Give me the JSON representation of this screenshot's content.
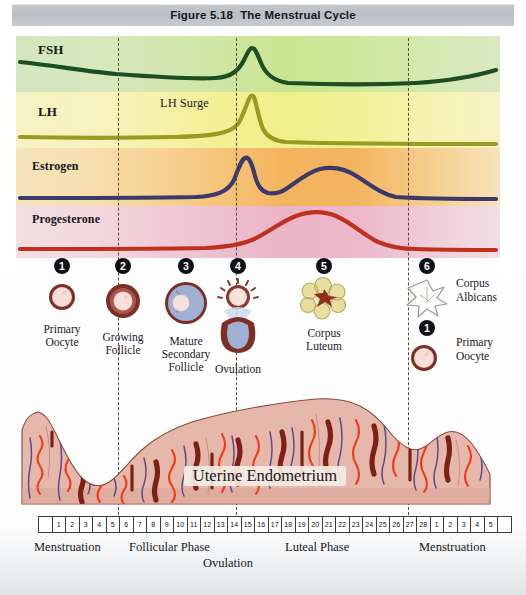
{
  "figure": {
    "number": "Figure 5.18",
    "title": "The Menstrual Cycle"
  },
  "hormones": {
    "fsh": {
      "label": "FSH",
      "color": "#1d4d22",
      "band_color": "#cfe6a4"
    },
    "lh": {
      "label": "LH",
      "color": "#9a9a22",
      "band_color": "#f2f095"
    },
    "estrogen": {
      "label": "Estrogen",
      "color": "#3b3a6b",
      "band_color": "#f4b45e"
    },
    "progesterone": {
      "label": "Progesterone",
      "color": "#c0301d",
      "band_color": "#eab4c6"
    }
  },
  "annotations": {
    "lh_surge": "LH Surge",
    "endometrium": "Uterine Endometrium",
    "ovulation_axis": "Ovulation"
  },
  "stages": [
    {
      "number": "1",
      "label": "Primary\nOocyte",
      "art": "primary-oocyte"
    },
    {
      "number": "2",
      "label": "Growing\nFollicle",
      "art": "growing-follicle"
    },
    {
      "number": "3",
      "label": "Mature\nSecondary\nFollicle",
      "art": "mature-secondary-follicle"
    },
    {
      "number": "4",
      "label": "Ovulation",
      "art": "ovulation"
    },
    {
      "number": "5",
      "label": "Corpus\nLuteum",
      "art": "corpus-luteum"
    },
    {
      "number": "6",
      "label": "Corpus\nAlbicans",
      "art": "corpus-albicans"
    },
    {
      "number": "1",
      "label": "Primary\nOocyte",
      "art": "primary-oocyte"
    }
  ],
  "day_scale": {
    "leading_blank": 1,
    "days": [
      "1",
      "2",
      "3",
      "4",
      "5",
      "6",
      "7",
      "8",
      "9",
      "10",
      "11",
      "12",
      "13",
      "14",
      "15",
      "16",
      "17",
      "18",
      "19",
      "20",
      "21",
      "22",
      "23",
      "24",
      "25",
      "26",
      "27",
      "28",
      "1",
      "2",
      "3",
      "4",
      "5"
    ],
    "trailing_blank": 1
  },
  "phases": [
    {
      "label": "Menstruation"
    },
    {
      "label": "Follicular Phase"
    },
    {
      "label": "Luteal Phase"
    },
    {
      "label": "Menstruation"
    }
  ],
  "chart_data": {
    "type": "line",
    "title": "The Menstrual Cycle",
    "xlabel": "Day of cycle",
    "ylabel": "Relative hormone level",
    "x": [
      1,
      2,
      3,
      4,
      5,
      6,
      7,
      8,
      9,
      10,
      11,
      12,
      13,
      14,
      15,
      16,
      17,
      18,
      19,
      20,
      21,
      22,
      23,
      24,
      25,
      26,
      27,
      28,
      29,
      30,
      31,
      32,
      33
    ],
    "xlim": [
      1,
      33
    ],
    "grid": false,
    "legend": "inline-left-labels",
    "series": [
      {
        "name": "FSH",
        "color": "#1d4d22",
        "values": [
          0.42,
          0.4,
          0.38,
          0.36,
          0.34,
          0.32,
          0.3,
          0.29,
          0.28,
          0.27,
          0.26,
          0.26,
          0.26,
          0.27,
          0.3,
          0.42,
          0.72,
          0.95,
          0.72,
          0.42,
          0.3,
          0.26,
          0.24,
          0.23,
          0.23,
          0.23,
          0.23,
          0.23,
          0.24,
          0.27,
          0.33,
          0.4,
          0.46
        ]
      },
      {
        "name": "LH",
        "color": "#9a9a22",
        "values": [
          0.22,
          0.21,
          0.21,
          0.2,
          0.2,
          0.2,
          0.19,
          0.19,
          0.19,
          0.19,
          0.19,
          0.2,
          0.22,
          0.3,
          0.55,
          0.9,
          1.0,
          0.72,
          0.4,
          0.25,
          0.18,
          0.14,
          0.12,
          0.11,
          0.1,
          0.1,
          0.1,
          0.1,
          0.1,
          0.1,
          0.1,
          0.1,
          0.1
        ]
      },
      {
        "name": "Estrogen",
        "color": "#3b3a6b",
        "values": [
          0.08,
          0.08,
          0.08,
          0.08,
          0.08,
          0.08,
          0.08,
          0.09,
          0.1,
          0.12,
          0.18,
          0.4,
          0.78,
          0.88,
          0.55,
          0.26,
          0.22,
          0.24,
          0.32,
          0.46,
          0.58,
          0.64,
          0.66,
          0.64,
          0.58,
          0.46,
          0.3,
          0.16,
          0.09,
          0.08,
          0.08,
          0.08,
          0.08
        ]
      },
      {
        "name": "Progesterone",
        "color": "#c0301d",
        "values": [
          0.05,
          0.05,
          0.05,
          0.05,
          0.05,
          0.05,
          0.05,
          0.05,
          0.05,
          0.05,
          0.05,
          0.05,
          0.06,
          0.08,
          0.14,
          0.26,
          0.44,
          0.62,
          0.76,
          0.84,
          0.86,
          0.84,
          0.76,
          0.62,
          0.42,
          0.24,
          0.12,
          0.07,
          0.05,
          0.05,
          0.05,
          0.05,
          0.05
        ]
      }
    ],
    "events": [
      {
        "name": "LH Surge",
        "day": 14
      },
      {
        "name": "Ovulation",
        "day": 14
      }
    ],
    "phase_spans": [
      {
        "label": "Menstruation",
        "from": 1,
        "to": 5
      },
      {
        "label": "Follicular Phase",
        "from": 6,
        "to": 14
      },
      {
        "label": "Luteal Phase",
        "from": 15,
        "to": 28
      },
      {
        "label": "Menstruation",
        "from": 29,
        "to": 33
      }
    ]
  }
}
